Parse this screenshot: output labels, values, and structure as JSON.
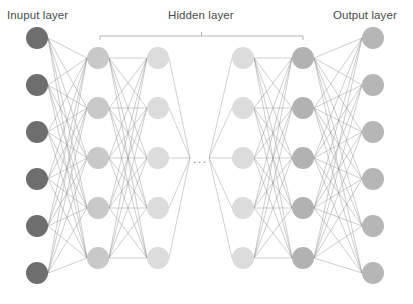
{
  "diagram": {
    "background_color": "#ffffff",
    "width": 413,
    "height": 304,
    "labels": {
      "input": "Inuput layer",
      "hidden": "Hidden layer",
      "output": "Output layer",
      "ellipsis": "..."
    },
    "label_color": "#4a4a4a",
    "edge_color": "#8c8c8c",
    "bracket_color": "#b5b5b5",
    "node_radius": 11,
    "hidden_bracket": {
      "x1": 100,
      "x2": 303,
      "y": 36,
      "tick_height": 4
    },
    "layers": [
      {
        "id": "input-layer",
        "name": "Inuput layer",
        "kind": "input",
        "node_count": 6,
        "color": "#6e6e6e",
        "x": 37,
        "node_y": [
          38,
          85,
          132,
          179,
          226,
          273
        ]
      },
      {
        "id": "hidden-layer-1",
        "name": "Hidden layer 1",
        "kind": "hidden",
        "node_count": 5,
        "color": "#c9c9c9",
        "x": 98,
        "node_y": [
          58,
          108,
          158,
          208,
          258
        ]
      },
      {
        "id": "hidden-layer-2",
        "name": "Hidden layer 2",
        "kind": "hidden",
        "node_count": 5,
        "color": "#dcdcdc",
        "x": 158,
        "node_y": [
          58,
          108,
          158,
          208,
          258
        ]
      },
      {
        "id": "hidden-layer-3",
        "name": "Hidden layer 3",
        "kind": "hidden",
        "node_count": 5,
        "color": "#dcdcdc",
        "x": 243,
        "node_y": [
          58,
          108,
          158,
          208,
          258
        ]
      },
      {
        "id": "hidden-layer-4",
        "name": "Hidden layer 4",
        "kind": "hidden",
        "node_count": 5,
        "color": "#b2b2b2",
        "x": 303,
        "node_y": [
          58,
          108,
          158,
          208,
          258
        ]
      },
      {
        "id": "output-layer",
        "name": "Output layer",
        "kind": "output",
        "node_count": 6,
        "color": "#b6b6b6",
        "x": 373,
        "node_y": [
          38,
          85,
          132,
          179,
          226,
          273
        ]
      }
    ],
    "connections": [
      {
        "from": "input-layer",
        "to": "hidden-layer-1",
        "style": "full"
      },
      {
        "from": "hidden-layer-1",
        "to": "hidden-layer-2",
        "style": "full"
      },
      {
        "from": "hidden-layer-2",
        "to": "ellipsis",
        "style": "stub-right"
      },
      {
        "from": "ellipsis",
        "to": "hidden-layer-3",
        "style": "stub-left"
      },
      {
        "from": "hidden-layer-3",
        "to": "hidden-layer-4",
        "style": "full"
      },
      {
        "from": "hidden-layer-4",
        "to": "output-layer",
        "style": "full"
      }
    ],
    "ellipsis_gap": {
      "x_center": 199,
      "y_center": 158,
      "left_edge": 190,
      "right_edge": 209
    }
  }
}
